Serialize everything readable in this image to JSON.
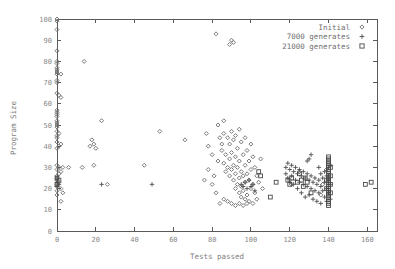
{
  "chart_data": {
    "type": "scatter",
    "title": "",
    "xlabel": "Tests passed",
    "ylabel": "Program Size",
    "xlim": [
      0,
      165
    ],
    "ylim": [
      0,
      100
    ],
    "xticks": [
      0,
      20,
      40,
      60,
      80,
      100,
      120,
      140,
      160
    ],
    "yticks": [
      0,
      10,
      20,
      30,
      40,
      50,
      60,
      70,
      80,
      90,
      100
    ],
    "grid": false,
    "legend_position": "top-right",
    "series": [
      {
        "name": "Initial",
        "marker": "diamond",
        "color": "#6b6b6b",
        "points": [
          [
            0,
            100
          ],
          [
            0,
            99
          ],
          [
            0,
            95
          ],
          [
            0,
            85
          ],
          [
            0,
            80
          ],
          [
            0,
            79
          ],
          [
            0,
            77
          ],
          [
            0,
            76
          ],
          [
            0,
            75
          ],
          [
            0,
            74
          ],
          [
            2,
            74
          ],
          [
            0,
            71
          ],
          [
            0,
            70
          ],
          [
            0,
            65
          ],
          [
            1,
            64
          ],
          [
            2,
            63
          ],
          [
            0,
            57
          ],
          [
            0,
            56
          ],
          [
            0,
            55
          ],
          [
            0,
            54
          ],
          [
            0,
            52
          ],
          [
            0,
            51
          ],
          [
            0,
            50
          ],
          [
            0,
            49
          ],
          [
            0,
            47
          ],
          [
            1,
            46
          ],
          [
            0,
            45
          ],
          [
            0,
            44
          ],
          [
            0,
            42
          ],
          [
            2,
            41
          ],
          [
            1,
            40
          ],
          [
            0,
            39
          ],
          [
            0,
            31
          ],
          [
            1,
            30
          ],
          [
            3,
            30
          ],
          [
            6,
            30
          ],
          [
            0,
            29
          ],
          [
            2,
            28
          ],
          [
            1,
            27
          ],
          [
            0,
            26
          ],
          [
            0,
            25
          ],
          [
            0,
            24
          ],
          [
            1,
            23
          ],
          [
            0,
            22
          ],
          [
            0,
            21
          ],
          [
            2,
            20
          ],
          [
            0,
            19
          ],
          [
            3,
            18
          ],
          [
            0,
            17
          ],
          [
            2,
            14
          ],
          [
            14,
            80
          ],
          [
            23,
            52
          ],
          [
            18,
            43
          ],
          [
            19,
            41
          ],
          [
            17,
            40
          ],
          [
            20,
            39
          ],
          [
            19,
            31
          ],
          [
            13,
            30
          ],
          [
            26,
            22
          ],
          [
            45,
            31
          ],
          [
            53,
            47
          ],
          [
            66,
            43
          ],
          [
            77,
            46
          ],
          [
            78,
            40
          ],
          [
            80,
            36
          ],
          [
            82,
            93
          ],
          [
            83,
            50
          ],
          [
            84,
            44
          ],
          [
            85,
            41
          ],
          [
            85,
            38
          ],
          [
            86,
            52
          ],
          [
            86,
            46
          ],
          [
            86,
            32
          ],
          [
            87,
            36
          ],
          [
            87,
            28
          ],
          [
            88,
            44
          ],
          [
            88,
            30
          ],
          [
            89,
            88
          ],
          [
            89,
            41
          ],
          [
            89,
            34
          ],
          [
            89,
            26
          ],
          [
            90,
            90
          ],
          [
            90,
            47
          ],
          [
            90,
            37
          ],
          [
            90,
            29
          ],
          [
            91,
            89
          ],
          [
            91,
            43
          ],
          [
            91,
            31
          ],
          [
            91,
            24
          ],
          [
            92,
            45
          ],
          [
            92,
            35
          ],
          [
            92,
            27
          ],
          [
            92,
            20
          ],
          [
            93,
            39
          ],
          [
            93,
            30
          ],
          [
            93,
            22
          ],
          [
            94,
            48
          ],
          [
            94,
            33
          ],
          [
            94,
            25
          ],
          [
            94,
            18
          ],
          [
            95,
            42
          ],
          [
            95,
            28
          ],
          [
            95,
            21
          ],
          [
            95,
            16
          ],
          [
            96,
            36
          ],
          [
            96,
            26
          ],
          [
            96,
            19
          ],
          [
            97,
            44
          ],
          [
            97,
            31
          ],
          [
            97,
            23
          ],
          [
            97,
            15
          ],
          [
            98,
            38
          ],
          [
            98,
            27
          ],
          [
            98,
            17
          ],
          [
            99,
            33
          ],
          [
            99,
            24
          ],
          [
            99,
            14
          ],
          [
            100,
            41
          ],
          [
            100,
            29
          ],
          [
            100,
            20
          ],
          [
            101,
            35
          ],
          [
            101,
            22
          ],
          [
            101,
            13
          ],
          [
            102,
            30
          ],
          [
            102,
            18
          ],
          [
            103,
            26
          ],
          [
            103,
            15
          ],
          [
            104,
            23
          ],
          [
            105,
            34
          ],
          [
            106,
            20
          ],
          [
            88,
            14
          ],
          [
            90,
            13
          ],
          [
            92,
            12
          ],
          [
            84,
            13
          ],
          [
            86,
            15
          ],
          [
            94,
            13
          ],
          [
            96,
            12
          ],
          [
            98,
            13
          ],
          [
            80,
            22
          ],
          [
            81,
            26
          ],
          [
            82,
            18
          ],
          [
            83,
            33
          ],
          [
            78,
            29
          ],
          [
            76,
            24
          ],
          [
            120,
            24
          ],
          [
            121,
            22
          ],
          [
            125,
            28
          ],
          [
            136,
            17
          ],
          [
            137,
            22
          ],
          [
            139,
            29
          ],
          [
            140,
            25
          ],
          [
            141,
            31
          ]
        ]
      },
      {
        "name": "7000 generates",
        "marker": "plus",
        "color": "#4f4f4f",
        "points": [
          [
            0,
            23
          ],
          [
            0,
            21
          ],
          [
            1,
            22
          ],
          [
            23,
            22
          ],
          [
            49,
            22
          ],
          [
            95,
            22
          ],
          [
            96,
            21
          ],
          [
            97,
            23
          ],
          [
            98,
            20
          ],
          [
            99,
            24
          ],
          [
            100,
            21
          ],
          [
            101,
            22
          ],
          [
            102,
            19
          ],
          [
            118,
            30
          ],
          [
            118,
            27
          ],
          [
            119,
            32
          ],
          [
            119,
            25
          ],
          [
            120,
            29
          ],
          [
            120,
            23
          ],
          [
            121,
            31
          ],
          [
            121,
            26
          ],
          [
            122,
            28
          ],
          [
            122,
            22
          ],
          [
            123,
            30
          ],
          [
            123,
            24
          ],
          [
            124,
            27
          ],
          [
            124,
            20
          ],
          [
            125,
            29
          ],
          [
            125,
            23
          ],
          [
            126,
            26
          ],
          [
            126,
            18
          ],
          [
            127,
            28
          ],
          [
            127,
            22
          ],
          [
            128,
            25
          ],
          [
            128,
            16
          ],
          [
            129,
            27
          ],
          [
            129,
            21
          ],
          [
            130,
            24
          ],
          [
            130,
            17
          ],
          [
            131,
            26
          ],
          [
            131,
            20
          ],
          [
            132,
            23
          ],
          [
            132,
            15
          ],
          [
            133,
            25
          ],
          [
            133,
            19
          ],
          [
            134,
            22
          ],
          [
            134,
            14
          ],
          [
            135,
            30
          ],
          [
            135,
            24
          ],
          [
            135,
            18
          ],
          [
            136,
            27
          ],
          [
            136,
            21
          ],
          [
            136,
            13
          ],
          [
            137,
            25
          ],
          [
            137,
            19
          ],
          [
            138,
            28
          ],
          [
            138,
            23
          ],
          [
            138,
            16
          ],
          [
            139,
            26
          ],
          [
            139,
            20
          ],
          [
            139,
            14
          ],
          [
            140,
            24
          ],
          [
            140,
            18
          ],
          [
            141,
            22
          ],
          [
            141,
            15
          ],
          [
            130,
            34
          ],
          [
            131,
            36
          ],
          [
            129,
            33
          ]
        ]
      },
      {
        "name": "21000 generates",
        "marker": "square",
        "color": "#4a4a4a",
        "points": [
          [
            0,
            25
          ],
          [
            0,
            22
          ],
          [
            1,
            24
          ],
          [
            104,
            28
          ],
          [
            105,
            26
          ],
          [
            110,
            16
          ],
          [
            113,
            23
          ],
          [
            119,
            24
          ],
          [
            120,
            22
          ],
          [
            121,
            25
          ],
          [
            124,
            23
          ],
          [
            125,
            27
          ],
          [
            126,
            24
          ],
          [
            127,
            21
          ],
          [
            128,
            25
          ],
          [
            129,
            23
          ],
          [
            131,
            18
          ],
          [
            140,
            35
          ],
          [
            140,
            34
          ],
          [
            140,
            33
          ],
          [
            140,
            32
          ],
          [
            140,
            31
          ],
          [
            140,
            30
          ],
          [
            140,
            29
          ],
          [
            140,
            28
          ],
          [
            140,
            27
          ],
          [
            140,
            26
          ],
          [
            140,
            25
          ],
          [
            140,
            24
          ],
          [
            140,
            23
          ],
          [
            140,
            22
          ],
          [
            140,
            21
          ],
          [
            140,
            20
          ],
          [
            140,
            19
          ],
          [
            140,
            18
          ],
          [
            140,
            17
          ],
          [
            140,
            16
          ],
          [
            140,
            15
          ],
          [
            140,
            14
          ],
          [
            140,
            13
          ],
          [
            140,
            12
          ],
          [
            141,
            30
          ],
          [
            141,
            26
          ],
          [
            141,
            22
          ],
          [
            141,
            18
          ],
          [
            139,
            24
          ],
          [
            139,
            20
          ],
          [
            162,
            23
          ],
          [
            159,
            22
          ]
        ]
      }
    ]
  },
  "axes": {
    "xlabel": "Tests passed",
    "ylabel": "Program Size"
  },
  "legend": {
    "entries": [
      {
        "label": "Initial",
        "marker": "diamond"
      },
      {
        "label": "7000 generates",
        "marker": "plus"
      },
      {
        "label": "21000 generates",
        "marker": "square"
      }
    ]
  }
}
